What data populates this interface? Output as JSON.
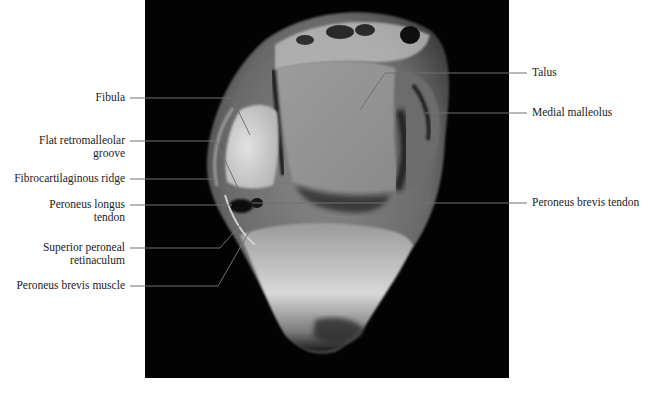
{
  "figure": {
    "type": "axial MRI of ankle with anatomical labels",
    "background": "#000000",
    "line_color": "#6e6e6e"
  },
  "labels_left": [
    {
      "id": "fibula",
      "lines": [
        "Fibula"
      ]
    },
    {
      "id": "flat-retromalleolar-groove",
      "lines": [
        "Flat retromalleolar",
        "groove"
      ]
    },
    {
      "id": "fibrocartilaginous-ridge",
      "lines": [
        "Fibrocartilaginous ridge"
      ]
    },
    {
      "id": "peroneus-longus-tendon",
      "lines": [
        "Peroneus longus",
        "tendon"
      ]
    },
    {
      "id": "superior-peroneal-retinaculum",
      "lines": [
        "Superior peroneal",
        "retinaculum"
      ]
    },
    {
      "id": "peroneus-brevis-muscle",
      "lines": [
        "Peroneus brevis muscle"
      ]
    }
  ],
  "labels_right": [
    {
      "id": "talus",
      "lines": [
        "Talus"
      ]
    },
    {
      "id": "medial-malleolus",
      "lines": [
        "Medial malleolus"
      ]
    },
    {
      "id": "peroneus-brevis-tendon",
      "lines": [
        "Peroneus brevis tendon"
      ]
    }
  ]
}
